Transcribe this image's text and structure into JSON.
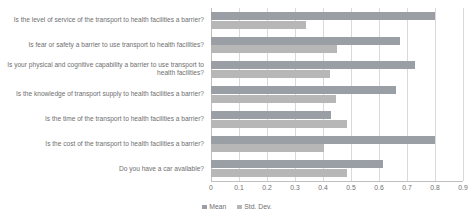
{
  "chart_data": {
    "type": "bar",
    "orientation": "horizontal",
    "title": "",
    "xlabel": "",
    "ylabel": "",
    "xlim": [
      0,
      0.9
    ],
    "xticks": [
      "0",
      "0.1",
      "0.2",
      "0.3",
      "0.4",
      "0.5",
      "0.6",
      "0.7",
      "0.8",
      "0.9"
    ],
    "xtick_values": [
      0,
      0.1,
      0.2,
      0.3,
      0.4,
      0.5,
      0.6,
      0.7,
      0.8,
      0.9
    ],
    "grid": "vertical",
    "legend_position": "bottom-center",
    "categories": [
      "Is the level of service of the transport to health facilities a barrier?",
      "Is fear or safety a barrier to use transport to health facilities?",
      "Is your physical and cognitive capability a barrier to use transport to health facilities?",
      "Is the knowledge of transport supply to health facilities a barrier?",
      "Is the time of the transport to health facilities a barrier?",
      "Is the cost of the transport to health facilities a barrier?",
      "Do you have a car available?"
    ],
    "series": [
      {
        "name": "Mean",
        "color": "#9a9fa6",
        "values": [
          0.8,
          0.675,
          0.73,
          0.66,
          0.43,
          0.8,
          0.615
        ]
      },
      {
        "name": "Std. Dev.",
        "color": "#b7b7b7",
        "values": [
          0.34,
          0.45,
          0.425,
          0.445,
          0.485,
          0.405,
          0.485
        ]
      }
    ]
  }
}
